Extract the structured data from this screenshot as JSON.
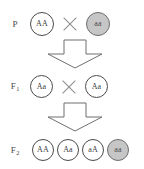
{
  "diagram": {
    "colors": {
      "background": "#ffffff",
      "circle_outline": "#4b4b4b",
      "circle_light_fill": "#ffffff",
      "circle_shaded_fill": "#c6c6c6",
      "circle_shaded_outline": "#6e6e6e",
      "cross_symbol": "#8d8d8d",
      "arrow_outline": "#6f6f6f",
      "text": "#3a3a3a"
    },
    "generations": [
      {
        "id": "p",
        "label_main": "P",
        "label_sub": "",
        "organisms": [
          {
            "genotype": "AA",
            "shading": "light"
          },
          {
            "genotype": "aa",
            "shading": "shaded"
          }
        ],
        "cross_symbol": "×"
      },
      {
        "id": "f1",
        "label_main": "F",
        "label_sub": "1",
        "organisms": [
          {
            "genotype": "Aa",
            "shading": "light"
          },
          {
            "genotype": "Aa",
            "shading": "light"
          }
        ],
        "cross_symbol": "×"
      },
      {
        "id": "f2",
        "label_main": "F",
        "label_sub": "2",
        "organisms": [
          {
            "genotype": "AA",
            "shading": "light"
          },
          {
            "genotype": "Aa",
            "shading": "light"
          },
          {
            "genotype": "aA",
            "shading": "light"
          },
          {
            "genotype": "aa",
            "shading": "shaded"
          }
        ],
        "cross_symbol": ""
      }
    ],
    "arrows": [
      {
        "id": "arrow-p-to-f1",
        "direction": "down"
      },
      {
        "id": "arrow-f1-to-f2",
        "direction": "down"
      }
    ]
  }
}
